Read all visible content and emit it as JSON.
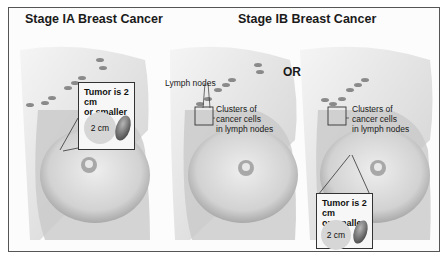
{
  "titles": {
    "stage_ia": "Stage IA Breast Cancer",
    "stage_ib": "Stage IB Breast Cancer",
    "or": "OR"
  },
  "panel1": {
    "callout_text_line1": "Tumor is 2 cm",
    "callout_text_line2": "or smaller",
    "circle_label": "2 cm"
  },
  "panel2": {
    "lymph_nodes_label": "Lymph nodes",
    "clusters_line1": "Clusters of",
    "clusters_line2": "cancer cells",
    "clusters_line3": "in lymph nodes"
  },
  "panel3": {
    "clusters_line1": "Clusters of",
    "clusters_line2": "cancer cells",
    "clusters_line3": "in lymph nodes",
    "callout_text_line1": "Tumor is 2 cm",
    "callout_text_line2": "or smaller",
    "circle_label": "2 cm"
  }
}
